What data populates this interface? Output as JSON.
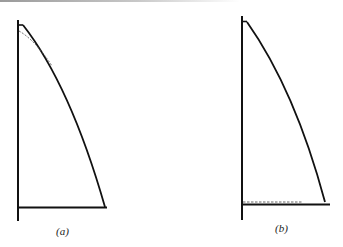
{
  "panels": [
    {
      "id": "a",
      "label": "(a)",
      "description": "Curved triangular profile with dashed line deviating near the top",
      "dashed_location": "top"
    },
    {
      "id": "b",
      "label": "(b)",
      "description": "Curved triangular profile with dashed line along the bottom base",
      "dashed_location": "bottom"
    }
  ],
  "colors": {
    "stroke": "#111111",
    "background": "#ffffff"
  }
}
